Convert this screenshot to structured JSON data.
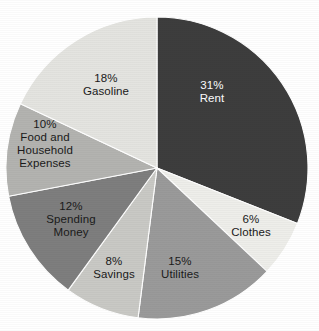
{
  "chart_data": {
    "type": "pie",
    "title": "",
    "subtitle": "",
    "xlabel": "",
    "ylabel": "",
    "legend_position": "none",
    "grid": false,
    "labels_inside_slices": true,
    "start_angle_deg": 0,
    "direction": "clockwise",
    "total": 100,
    "value_unit": "%",
    "categories": [
      "Rent",
      "Clothes",
      "Utilities",
      "Savings",
      "Spending Money",
      "Food and Household Expenses",
      "Gasoline"
    ],
    "values": [
      31,
      6,
      15,
      8,
      12,
      10,
      18
    ],
    "slices": [
      {
        "name": "Rent",
        "percent_text": "31%",
        "value": 31,
        "label_lines": [
          "31%",
          "Rent"
        ],
        "fill": "#3d3d3d",
        "text_color": "#ffffff",
        "label_x": 212,
        "label_y": 92
      },
      {
        "name": "Clothes",
        "percent_text": "6%",
        "value": 6,
        "label_lines": [
          "6%",
          "Clothes"
        ],
        "fill": "#eeeeea",
        "text_color": "#1a1a1a",
        "label_x": 251,
        "label_y": 226
      },
      {
        "name": "Utilities",
        "percent_text": "15%",
        "value": 15,
        "label_lines": [
          "15%",
          "Utilities"
        ],
        "fill": "#9a9a9a",
        "text_color": "#1a1a1a",
        "label_x": 180,
        "label_y": 268
      },
      {
        "name": "Savings",
        "percent_text": "8%",
        "value": 8,
        "label_lines": [
          "8%",
          "Savings"
        ],
        "fill": "#c9c9c5",
        "text_color": "#1a1a1a",
        "label_x": 114,
        "label_y": 268
      },
      {
        "name": "Spending Money",
        "percent_text": "12%",
        "value": 12,
        "label_lines": [
          "12%",
          "Spending",
          "Money"
        ],
        "fill": "#7e7e7e",
        "text_color": "#1a1a1a",
        "label_x": 71,
        "label_y": 220
      },
      {
        "name": "Food and Household Expenses",
        "percent_text": "10%",
        "value": 10,
        "label_lines": [
          "10%",
          "Food and",
          "Household",
          "Expenses"
        ],
        "fill": "#b3b3b0",
        "text_color": "#1a1a1a",
        "label_x": 45,
        "label_y": 144
      },
      {
        "name": "Gasoline",
        "percent_text": "18%",
        "value": 18,
        "label_lines": [
          "18%",
          "Gasoline"
        ],
        "fill": "#e4e4e0",
        "text_color": "#1a1a1a",
        "label_x": 106,
        "label_y": 85
      }
    ],
    "geometry": {
      "center_x": 157,
      "center_y": 168,
      "radius": 151
    },
    "colors": {
      "background": "#ffffff",
      "slice_outline": "#ffffff"
    }
  }
}
